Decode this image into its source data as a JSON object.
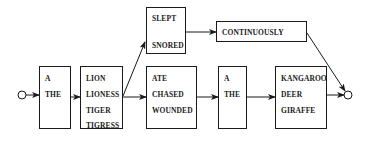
{
  "diagram": {
    "type": "finite-state-grammar",
    "start_node": "start",
    "end_node": "end",
    "colors": {
      "stroke": "#1a1a1a",
      "background": "#ffffff"
    },
    "boxes": [
      {
        "id": "det1",
        "words": [
          "A",
          "THE"
        ]
      },
      {
        "id": "noun1",
        "words": [
          "LION",
          "LIONESS",
          "TIGER",
          "TIGRESS"
        ]
      },
      {
        "id": "intrans",
        "words": [
          "SLEPT",
          "SNORED"
        ]
      },
      {
        "id": "adverb",
        "words": [
          "CONTINUOUSLY"
        ]
      },
      {
        "id": "trans",
        "words": [
          "ATE",
          "CHASED",
          "WOUNDED"
        ]
      },
      {
        "id": "det2",
        "words": [
          "A",
          "THE"
        ]
      },
      {
        "id": "noun2",
        "words": [
          "KANGAROO",
          "DEER",
          "GIRAFFE"
        ]
      }
    ],
    "edges": [
      [
        "start",
        "det1"
      ],
      [
        "det1",
        "noun1"
      ],
      [
        "noun1",
        "intrans"
      ],
      [
        "noun1",
        "trans"
      ],
      [
        "intrans",
        "adverb"
      ],
      [
        "adverb",
        "end"
      ],
      [
        "trans",
        "det2"
      ],
      [
        "det2",
        "noun2"
      ],
      [
        "noun2",
        "end"
      ]
    ]
  }
}
